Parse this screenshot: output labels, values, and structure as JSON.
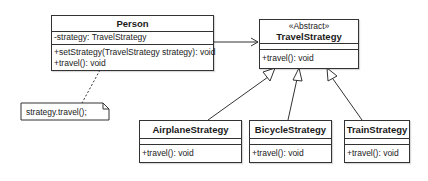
{
  "classes": {
    "person": {
      "name": "Person",
      "attributes": [
        "-strategy: TravelStrategy"
      ],
      "methods": [
        "+setStrategy(TravelStrategy strategy): void",
        "+travel(): void"
      ]
    },
    "travel_strategy": {
      "stereotype": "«Abstract»",
      "name": "TravelStrategy",
      "attributes": [],
      "methods": [
        "+travel(): void"
      ]
    },
    "airplane_strategy": {
      "name": "AirplaneStrategy",
      "attributes": [],
      "methods": [
        "+travel(): void"
      ]
    },
    "bicycle_strategy": {
      "name": "BicycleStrategy",
      "attributes": [],
      "methods": [
        "+travel(): void"
      ]
    },
    "train_strategy": {
      "name": "TrainStrategy",
      "attributes": [],
      "methods": [
        "+travel(): void"
      ]
    }
  },
  "note": {
    "text": "strategy.travel();"
  },
  "relationships": [
    {
      "type": "association",
      "from": "Person",
      "to": "TravelStrategy"
    },
    {
      "type": "generalization",
      "from": "AirplaneStrategy",
      "to": "TravelStrategy"
    },
    {
      "type": "generalization",
      "from": "BicycleStrategy",
      "to": "TravelStrategy"
    },
    {
      "type": "generalization",
      "from": "TrainStrategy",
      "to": "TravelStrategy"
    },
    {
      "type": "note-link",
      "from": "note",
      "to": "Person"
    }
  ]
}
